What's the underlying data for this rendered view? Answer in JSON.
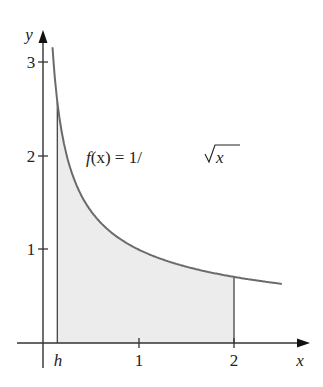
{
  "chart_data": {
    "type": "area",
    "title": "",
    "function_label": "f(x) = 1/√x",
    "xlabel": "x",
    "ylabel": "y",
    "x_ticks": [
      "h",
      "1",
      "2"
    ],
    "y_ticks": [
      "1",
      "2",
      "3"
    ],
    "h": 0.15,
    "shaded_interval": [
      0.15,
      2
    ],
    "curve_domain": [
      0.1,
      2.5
    ],
    "xlim": [
      -0.15,
      2.75
    ],
    "ylim": [
      -0.3,
      3.2
    ],
    "grid": false,
    "colors": {
      "curve": "#6b6b6b",
      "fill": "#ececec",
      "axis": "#333333"
    }
  },
  "labels": {
    "x_axis": "x",
    "y_axis": "y",
    "tick_h": "h",
    "tick_x1": "1",
    "tick_x2": "2",
    "tick_y1": "1",
    "tick_y2": "2",
    "tick_y3": "3",
    "func_f": "f",
    "func_rest": "(x) = 1/",
    "func_x": "x"
  }
}
